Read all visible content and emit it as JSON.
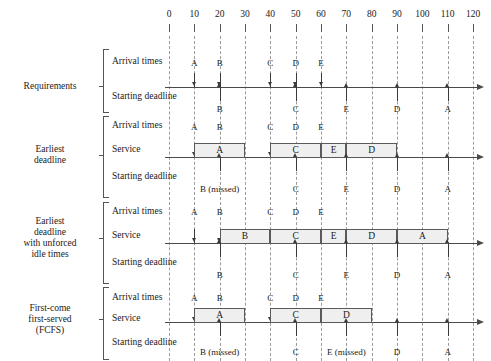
{
  "figure": {
    "type": "gantt-schedule-diagram",
    "axis": {
      "min": 0,
      "max": 120,
      "step": 10,
      "ticks": [
        "0",
        "10",
        "20",
        "30",
        "40",
        "50",
        "60",
        "70",
        "80",
        "90",
        "100",
        "110",
        "120"
      ]
    },
    "row_labels": {
      "arrival": "Arrival times",
      "service": "Service",
      "deadline": "Starting deadline"
    }
  },
  "sections": [
    {
      "id": "requirements",
      "title": "Requirements",
      "title_lines": [
        "Requirements"
      ],
      "rows": [
        {
          "id": "req-arrival",
          "label": "Arrival times",
          "kind": "arrival",
          "events": [
            {
              "task": "A",
              "time": 10
            },
            {
              "task": "B",
              "time": 20
            },
            {
              "task": "C",
              "time": 40
            },
            {
              "task": "D",
              "time": 50
            },
            {
              "task": "E",
              "time": 60
            }
          ]
        },
        {
          "id": "req-deadline",
          "label": "Starting deadline",
          "kind": "deadline",
          "events": [
            {
              "task": "B",
              "time": 20
            },
            {
              "task": "C",
              "time": 50
            },
            {
              "task": "E",
              "time": 70
            },
            {
              "task": "D",
              "time": 90
            },
            {
              "task": "A",
              "time": 110
            }
          ]
        }
      ]
    },
    {
      "id": "earliest-deadline",
      "title": "Earliest deadline",
      "title_lines": [
        "Earliest",
        "deadline"
      ],
      "rows": [
        {
          "id": "ed-arrival",
          "label": "Arrival times",
          "kind": "arrival",
          "events": [
            {
              "task": "A",
              "time": 10
            },
            {
              "task": "B",
              "time": 20
            },
            {
              "task": "C",
              "time": 40
            },
            {
              "task": "D",
              "time": 50
            },
            {
              "task": "E",
              "time": 60
            }
          ]
        },
        {
          "id": "ed-service",
          "label": "Service",
          "kind": "service",
          "blocks": [
            {
              "task": "A",
              "start": 10,
              "end": 30
            },
            {
              "task": "C",
              "start": 40,
              "end": 60
            },
            {
              "task": "E",
              "start": 60,
              "end": 70
            },
            {
              "task": "D",
              "start": 70,
              "end": 90
            }
          ]
        },
        {
          "id": "ed-deadline",
          "label": "Starting deadline",
          "kind": "deadline",
          "events": [
            {
              "task": "B (missed)",
              "time": 20
            },
            {
              "task": "C",
              "time": 50
            },
            {
              "task": "E",
              "time": 70
            },
            {
              "task": "D",
              "time": 90
            },
            {
              "task": "A",
              "time": 110
            }
          ]
        }
      ]
    },
    {
      "id": "earliest-deadline-unforced-idle",
      "title": "Earliest deadline with unforced idle times",
      "title_lines": [
        "Earliest",
        "deadline",
        "with unforced",
        "idle times"
      ],
      "rows": [
        {
          "id": "edi-arrival",
          "label": "Arrival times",
          "kind": "arrival",
          "events": [
            {
              "task": "A",
              "time": 10
            },
            {
              "task": "B",
              "time": 20
            },
            {
              "task": "C",
              "time": 40
            },
            {
              "task": "D",
              "time": 50
            },
            {
              "task": "E",
              "time": 60
            }
          ]
        },
        {
          "id": "edi-service",
          "label": "Service",
          "kind": "service",
          "blocks": [
            {
              "task": "B",
              "start": 20,
              "end": 40
            },
            {
              "task": "C",
              "start": 40,
              "end": 60
            },
            {
              "task": "E",
              "start": 60,
              "end": 70
            },
            {
              "task": "D",
              "start": 70,
              "end": 90
            },
            {
              "task": "A",
              "start": 90,
              "end": 110
            }
          ]
        },
        {
          "id": "edi-deadline",
          "label": "Starting deadline",
          "kind": "deadline",
          "events": [
            {
              "task": "B",
              "time": 20
            },
            {
              "task": "C",
              "time": 50
            },
            {
              "task": "E",
              "time": 70
            },
            {
              "task": "D",
              "time": 90
            },
            {
              "task": "A",
              "time": 110
            }
          ]
        }
      ]
    },
    {
      "id": "fcfs",
      "title": "First-come first-served (FCFS)",
      "title_lines": [
        "First-come",
        "first-served",
        "(FCFS)"
      ],
      "rows": [
        {
          "id": "fcfs-arrival",
          "label": "Arrival times",
          "kind": "arrival",
          "events": [
            {
              "task": "A",
              "time": 10
            },
            {
              "task": "B",
              "time": 20
            },
            {
              "task": "C",
              "time": 40
            },
            {
              "task": "D",
              "time": 50
            },
            {
              "task": "E",
              "time": 60
            }
          ]
        },
        {
          "id": "fcfs-service",
          "label": "Service",
          "kind": "service",
          "blocks": [
            {
              "task": "A",
              "start": 10,
              "end": 30
            },
            {
              "task": "C",
              "start": 40,
              "end": 60
            },
            {
              "task": "D",
              "start": 60,
              "end": 80
            }
          ]
        },
        {
          "id": "fcfs-deadline",
          "label": "Starting deadline",
          "kind": "deadline",
          "events": [
            {
              "task": "B (missed)",
              "time": 20
            },
            {
              "task": "C",
              "time": 50
            },
            {
              "task": "E (missed)",
              "time": 70
            },
            {
              "task": "D",
              "time": 90
            },
            {
              "task": "A",
              "time": 110
            }
          ]
        }
      ]
    }
  ],
  "colors": {
    "block_fill": "#efefef",
    "block_border": "#5a5a5a",
    "axis": "#4a4a4a",
    "grid": "#9a9a9a",
    "text": "#1a1a1a"
  }
}
